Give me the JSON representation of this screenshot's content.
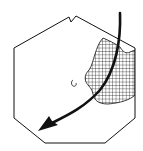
{
  "figure": {
    "type": "schematic diagram",
    "shape": "octagon with notch at top edge",
    "elements": [
      {
        "name": "octagon-outline",
        "description": "irregular octagon outline with small V notch on top edge"
      },
      {
        "name": "hatched-region",
        "description": "cross-hatched irregular region on right side of octagon"
      },
      {
        "name": "center-mark",
        "description": "small open circle near center"
      },
      {
        "name": "curved-arrow",
        "description": "thick curved arrow entering from top right, sweeping to lower left"
      }
    ],
    "colors": {
      "stroke": "#111111",
      "background": "#ffffff"
    }
  },
  "top_text": {
    "label": "·· ··· ·····"
  }
}
